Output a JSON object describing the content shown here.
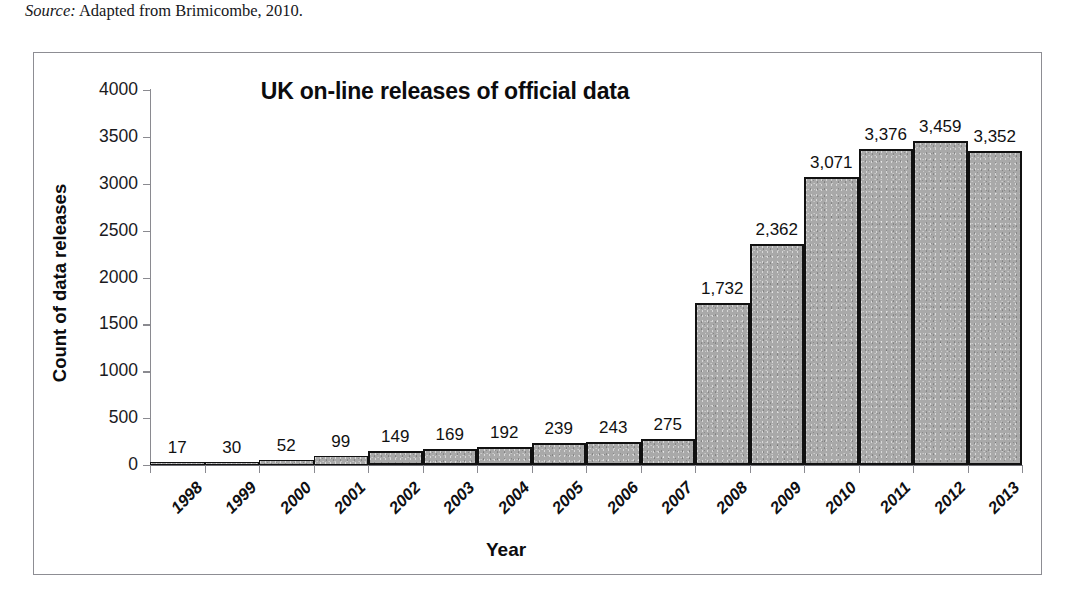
{
  "source_note": {
    "label": "Source:",
    "text": " Adapted from Brimicombe, 2010."
  },
  "x_axis_title": "Year",
  "y_axis_title": "Count of data releases",
  "chart_data": {
    "type": "bar",
    "title": "UK on-line releases of official data",
    "xlabel": "Year",
    "ylabel": "Count of data releases",
    "ylim": [
      0,
      4000
    ],
    "ytick_step": 500,
    "yticks": [
      "4000",
      "3500",
      "3000",
      "2500",
      "2000",
      "1500",
      "1000",
      "500",
      "0"
    ],
    "grid": false,
    "legend": "none",
    "bar_color": "#a9a9a9",
    "bar_border_color": "#111111",
    "categories": [
      "1998",
      "1999",
      "2000",
      "2001",
      "2002",
      "2003",
      "2004",
      "2005",
      "2006",
      "2007",
      "2008",
      "2009",
      "2010",
      "2011",
      "2012",
      "2013"
    ],
    "values": [
      17,
      30,
      52,
      99,
      149,
      169,
      192,
      239,
      243,
      275,
      1732,
      2362,
      3071,
      3376,
      3459,
      3352
    ],
    "data_labels": [
      "17",
      "30",
      "52",
      "99",
      "149",
      "169",
      "192",
      "239",
      "243",
      "275",
      "1,732",
      "2,362",
      "3,071",
      "3,376",
      "3,459",
      "3,352"
    ]
  }
}
